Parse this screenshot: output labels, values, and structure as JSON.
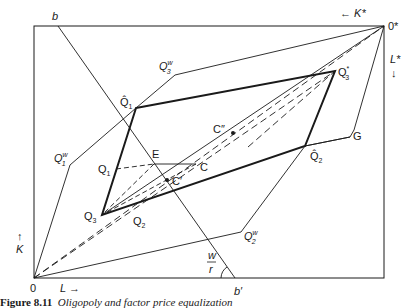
{
  "figure": {
    "caption_number": "Figure 8.11",
    "caption_title": "Oligopoly and factor price equalization",
    "colors": {
      "line": "#1a1a1a",
      "background": "#ffffff"
    }
  },
  "labels": {
    "b": "b",
    "b_prime": "b′",
    "origin": "0",
    "origin_star": "0*",
    "K_axis": "K",
    "L_axis": "L →",
    "K_star_axis": "← K*",
    "L_star_axis": "L*",
    "Q1w": "Q",
    "Q1w_sup": "w",
    "Q1w_sub": "1",
    "Q2w": "Q",
    "Q2w_sup": "w",
    "Q2w_sub": "2",
    "Q3w": "Q",
    "Q3w_sup": "w",
    "Q3w_sub": "3",
    "Q1hat": "Q̂",
    "Q1hat_sub": "1",
    "Q2hat": "Q̂",
    "Q2hat_sub": "2",
    "Q3star": "Q",
    "Q3star_sup": "*",
    "Q3star_sub": "3",
    "Q1": "Q",
    "Q1_sub": "1",
    "Q2": "Q",
    "Q2_sub": "2",
    "Q3": "Q",
    "Q3_sub": "3",
    "E": "E",
    "C": "C",
    "C_prime": "C′",
    "C_dprime": "C″",
    "G": "G",
    "wage_ratio_num": "w",
    "wage_ratio_den": "r"
  }
}
